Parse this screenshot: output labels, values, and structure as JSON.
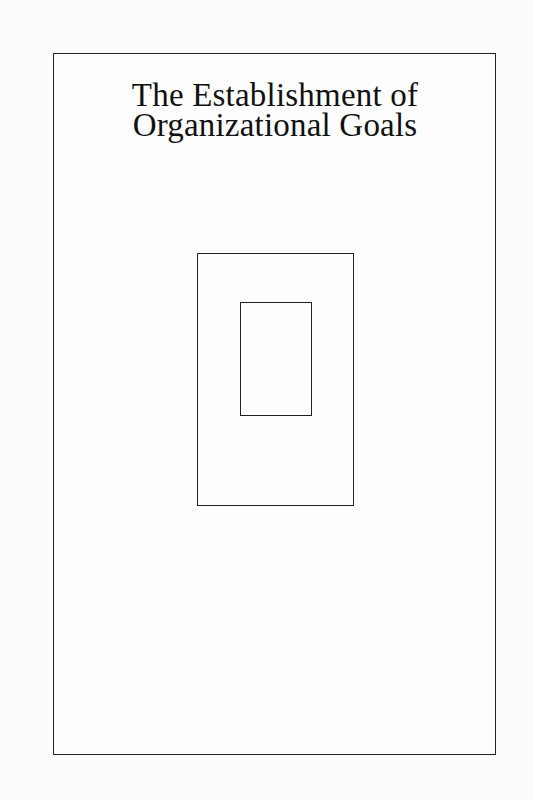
{
  "cover": {
    "title_lines": [
      "The Establishment of",
      "Organizational Goals"
    ],
    "colors": {
      "background": "#fcfcfb",
      "ink": "#222222"
    },
    "graphic": {
      "description": "nested-rectangles",
      "outer_rect": {
        "x": 197,
        "y": 253,
        "w": 157,
        "h": 253
      },
      "inner_rect": {
        "x": 240,
        "y": 302,
        "w": 72,
        "h": 114
      }
    }
  }
}
